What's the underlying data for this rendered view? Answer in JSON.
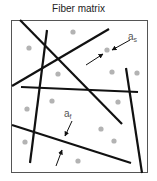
{
  "title": "Fiber matrix",
  "colors": {
    "fiber": "#111111",
    "particle": "#b3b3b3",
    "frame": "#555555",
    "label": "#555555"
  },
  "labels": {
    "spacing": {
      "base": "a",
      "sub": "s"
    },
    "fiber_width": {
      "base": "a",
      "sub": "f"
    }
  },
  "frame": {
    "x": 11,
    "y": 20,
    "width": 137,
    "height": 153
  },
  "fibers": [
    {
      "x1": 20,
      "y1": 20,
      "x2": 122,
      "y2": 124
    },
    {
      "x1": 47,
      "y1": 30,
      "x2": 30,
      "y2": 163
    },
    {
      "x1": 12,
      "y1": 86,
      "x2": 109,
      "y2": 29
    },
    {
      "x1": 21,
      "y1": 87,
      "x2": 138,
      "y2": 92
    },
    {
      "x1": 126,
      "y1": 68,
      "x2": 142,
      "y2": 173
    },
    {
      "x1": 12,
      "y1": 125,
      "x2": 131,
      "y2": 163
    }
  ],
  "particles": [
    {
      "cx": 29,
      "cy": 48
    },
    {
      "cx": 73,
      "cy": 32
    },
    {
      "cx": 107,
      "cy": 50
    },
    {
      "cx": 58,
      "cy": 74
    },
    {
      "cx": 112,
      "cy": 72
    },
    {
      "cx": 137,
      "cy": 73
    },
    {
      "cx": 52,
      "cy": 101
    },
    {
      "cx": 27,
      "cy": 109
    },
    {
      "cx": 118,
      "cy": 102
    },
    {
      "cx": 101,
      "cy": 129
    },
    {
      "cx": 114,
      "cy": 141
    },
    {
      "cx": 25,
      "cy": 142
    },
    {
      "cx": 78,
      "cy": 161
    }
  ]
}
